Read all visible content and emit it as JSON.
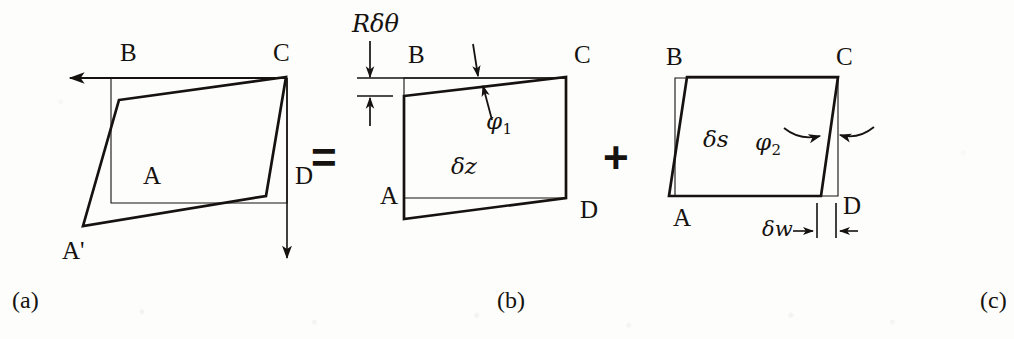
{
  "figure": {
    "background_color": "#fdfdfb",
    "ink_color": "#15120f"
  },
  "operators": [
    {
      "name": "equals",
      "symbol": "=",
      "x": 311,
      "y": 136
    },
    {
      "name": "plus",
      "symbol": "+",
      "x": 603,
      "y": 136
    }
  ],
  "captions": [
    {
      "id": "a",
      "text": "(a)",
      "x": 12,
      "y": 288
    },
    {
      "id": "b",
      "text": "(b)",
      "x": 497,
      "y": 288
    },
    {
      "id": "c",
      "text": "(c)",
      "x": 980,
      "y": 288
    }
  ],
  "panels": {
    "a": {
      "id": "a",
      "caption": "(a)",
      "vertex_labels": [
        {
          "name": "B",
          "text": "B",
          "x": 120,
          "y": 40
        },
        {
          "name": "C",
          "text": "C",
          "x": 273,
          "y": 40
        },
        {
          "name": "A",
          "text": "A",
          "x": 143,
          "y": 163
        },
        {
          "name": "D",
          "text": "D",
          "x": 295,
          "y": 163
        },
        {
          "name": "A-prime",
          "text": "A'",
          "x": 62,
          "y": 238
        }
      ],
      "reference_rect": {
        "left": 111,
        "top": 78,
        "right": 287,
        "bottom": 203
      },
      "deformed_quad": [
        {
          "x": 119,
          "y": 100
        },
        {
          "x": 286,
          "y": 77
        },
        {
          "x": 266,
          "y": 196
        },
        {
          "x": 83,
          "y": 226
        }
      ],
      "arrows": [
        {
          "name": "top-left-arrow",
          "direction": "left",
          "from_x": 287,
          "from_y": 78,
          "to_x": 65,
          "to_y": 78
        },
        {
          "name": "right-down-arrow",
          "direction": "down",
          "from_x": 287,
          "from_y": 78,
          "to_x": 287,
          "to_y": 262
        }
      ]
    },
    "b": {
      "id": "b",
      "caption": "(b)",
      "vertex_labels": [
        {
          "name": "B",
          "text": "B",
          "x": 408,
          "y": 42
        },
        {
          "name": "C",
          "text": "C",
          "x": 574,
          "y": 42
        },
        {
          "name": "A",
          "text": "A",
          "x": 380,
          "y": 183
        },
        {
          "name": "D",
          "text": "D",
          "x": 580,
          "y": 197
        }
      ],
      "annotations": [
        {
          "name": "R-delta-theta",
          "text": "Rδθ",
          "x": 352,
          "y": 12,
          "style": "italic"
        },
        {
          "name": "phi-1",
          "text": "φ",
          "sub": "1",
          "x": 486,
          "y": 110
        },
        {
          "name": "delta-z",
          "text": "δz",
          "x": 451,
          "y": 155
        }
      ],
      "reference_rect": {
        "left": 404,
        "top": 78,
        "right": 566,
        "bottom": 198
      },
      "deformed_quad": [
        {
          "x": 404,
          "y": 96
        },
        {
          "x": 566,
          "y": 77
        },
        {
          "x": 566,
          "y": 198
        },
        {
          "x": 404,
          "y": 219
        }
      ],
      "dimension": {
        "name": "R-delta-theta-dimension",
        "top_tick_y": 78,
        "bottom_tick_y": 96,
        "x": 370,
        "extent_left": 357,
        "extent_right": 395
      },
      "angle_markers": [
        {
          "name": "phi-1-upper-tick",
          "x1": 474,
          "y1": 46,
          "x2": 478,
          "y2": 76
        },
        {
          "name": "phi-1-lower-tick",
          "x1": 489,
          "y1": 86,
          "x2": 479,
          "y2": 119
        }
      ]
    },
    "c": {
      "id": "c",
      "caption": "(c)",
      "vertex_labels": [
        {
          "name": "B",
          "text": "B",
          "x": 666,
          "y": 44
        },
        {
          "name": "C",
          "text": "C",
          "x": 836,
          "y": 44
        },
        {
          "name": "A",
          "text": "A",
          "x": 673,
          "y": 211
        },
        {
          "name": "D",
          "text": "D",
          "x": 843,
          "y": 196
        }
      ],
      "annotations": [
        {
          "name": "delta-s",
          "text": "δs",
          "x": 703,
          "y": 128
        },
        {
          "name": "phi-2",
          "text": "φ",
          "sub": "2",
          "x": 755,
          "y": 131
        },
        {
          "name": "delta-w",
          "text": "δw",
          "x": 768,
          "y": 219
        }
      ],
      "reference_rect": {
        "left": 675,
        "top": 78,
        "right": 838,
        "bottom": 196
      },
      "deformed_quad": [
        {
          "x": 687,
          "y": 77
        },
        {
          "x": 838,
          "y": 77
        },
        {
          "x": 821,
          "y": 196
        },
        {
          "x": 669,
          "y": 196
        }
      ],
      "dimension": {
        "name": "delta-w-dimension",
        "y": 232,
        "left_x": 815,
        "right_x": 836,
        "tick_top": 204,
        "label_tail_x": 795
      },
      "angle_markers": [
        {
          "name": "phi-2-left-curved-arrow",
          "from_x": 785,
          "to_x": 824,
          "y": 135
        },
        {
          "name": "phi-2-right-curved-arrow",
          "from_x": 872,
          "to_x": 838,
          "y": 133
        }
      ]
    }
  }
}
